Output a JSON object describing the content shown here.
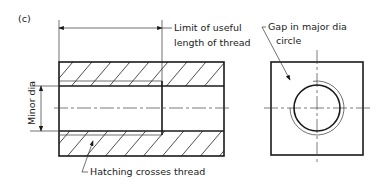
{
  "figure": {
    "label": "(c)",
    "annotations": {
      "limit_line1": "Limit of useful",
      "limit_line2": "length of thread",
      "gap_line1": "Gap in major dia",
      "gap_line2": "circle",
      "minor_dia": "Minor dia",
      "hatching": "Hatching crosses thread"
    }
  }
}
